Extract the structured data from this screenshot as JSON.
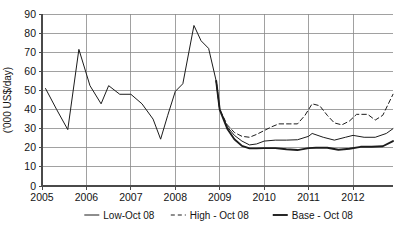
{
  "chart_data": {
    "type": "line",
    "title": "",
    "xlabel": "",
    "ylabel": "('000 US$/day)",
    "xlim": [
      2005.0,
      2012.9
    ],
    "ylim": [
      0,
      90
    ],
    "ytick_step": 10,
    "yticks": [
      0,
      10,
      20,
      30,
      40,
      50,
      60,
      70,
      80,
      90
    ],
    "xticks": [
      2005,
      2006,
      2007,
      2008,
      2009,
      2010,
      2011,
      2012
    ],
    "xtick_labels": [
      "2005",
      "2006",
      "2007",
      "2008",
      "2009",
      "2010",
      "2011",
      "2012"
    ],
    "grid": "both",
    "legend_position": "bottom",
    "series": [
      {
        "name": "Low-Oct 08",
        "style": "solid",
        "linewidth": 1.0,
        "x": [
          2005.08,
          2005.33,
          2005.58,
          2005.83,
          2006.08,
          2006.33,
          2006.5,
          2006.75,
          2007.0,
          2007.25,
          2007.5,
          2007.67,
          2007.83,
          2008.0,
          2008.17,
          2008.42,
          2008.58,
          2008.75,
          2008.92,
          2009.0,
          2009.17,
          2009.33,
          2009.5,
          2009.67,
          2009.83,
          2010.0,
          2010.25,
          2010.5,
          2010.75,
          2011.0,
          2011.08,
          2011.33,
          2011.58,
          2011.83,
          2012.0,
          2012.25,
          2012.5,
          2012.75,
          2012.9
        ],
        "y": [
          51.0,
          40.0,
          29.5,
          71.5,
          52.5,
          43.0,
          52.5,
          48.0,
          48.0,
          43.0,
          35.0,
          24.5,
          37.0,
          49.5,
          53.5,
          84.0,
          76.0,
          72.0,
          55.0,
          40.0,
          31.0,
          26.5,
          23.5,
          21.5,
          22.0,
          23.5,
          24.0,
          24.0,
          24.2,
          26.0,
          27.5,
          25.5,
          24.0,
          25.5,
          26.5,
          25.5,
          25.5,
          27.5,
          30.0
        ]
      },
      {
        "name": "High - Oct 08",
        "style": "dashed",
        "linewidth": 1.0,
        "x": [
          2008.92,
          2009.0,
          2009.17,
          2009.33,
          2009.5,
          2009.67,
          2009.83,
          2010.0,
          2010.17,
          2010.33,
          2010.58,
          2010.75,
          2010.92,
          2011.08,
          2011.25,
          2011.42,
          2011.58,
          2011.75,
          2011.92,
          2012.08,
          2012.33,
          2012.5,
          2012.67,
          2012.9
        ],
        "y": [
          55.0,
          40.0,
          32.0,
          28.0,
          26.0,
          25.5,
          27.0,
          29.0,
          31.0,
          32.5,
          32.5,
          32.5,
          37.0,
          43.0,
          42.0,
          37.0,
          33.0,
          32.0,
          34.0,
          37.5,
          37.5,
          34.5,
          37.0,
          48.0
        ]
      },
      {
        "name": "Base - Oct 08",
        "style": "solid",
        "linewidth": 1.9,
        "x": [
          2008.92,
          2009.0,
          2009.17,
          2009.33,
          2009.5,
          2009.67,
          2009.83,
          2010.0,
          2010.25,
          2010.5,
          2010.75,
          2011.0,
          2011.17,
          2011.42,
          2011.67,
          2011.92,
          2012.17,
          2012.42,
          2012.67,
          2012.9
        ],
        "y": [
          55.0,
          40.0,
          30.0,
          24.5,
          21.0,
          19.7,
          19.7,
          19.8,
          19.8,
          19.2,
          18.8,
          19.8,
          20.0,
          20.0,
          19.0,
          19.5,
          20.5,
          20.5,
          20.8,
          23.5
        ]
      }
    ],
    "legend": [
      {
        "label": "Low-Oct 08",
        "style": "solid",
        "linewidth": 1.0
      },
      {
        "label": "High - Oct 08",
        "style": "dashed",
        "linewidth": 1.0
      },
      {
        "label": "Base - Oct 08",
        "style": "solid",
        "linewidth": 1.9
      }
    ],
    "colors": {
      "line": "#1c1c1c",
      "grid": "#8a8a8a",
      "axis": "#4a4a4a",
      "background": "#ffffff",
      "text": "#141414"
    }
  }
}
